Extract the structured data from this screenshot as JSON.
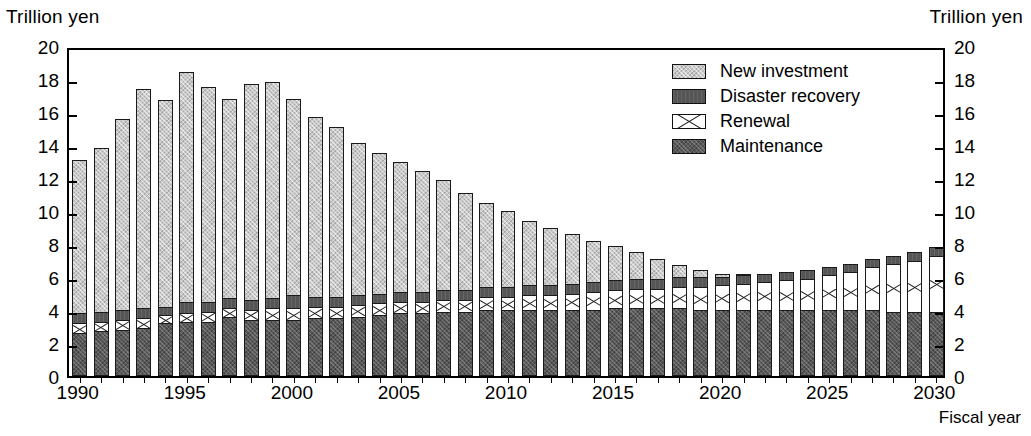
{
  "axis": {
    "unit_left": "Trillion yen",
    "unit_right": "Trillion yen",
    "xlabel": "Fiscal year"
  },
  "legend": {
    "items": [
      {
        "label": "New investment",
        "key": "new_investment",
        "swatch": "light-gray-hatch"
      },
      {
        "label": "Disaster recovery",
        "key": "disaster_recovery",
        "swatch": "dark-gray-solid"
      },
      {
        "label": "Renewal",
        "key": "renewal",
        "swatch": "white-cross-hatch"
      },
      {
        "label": "Maintenance",
        "key": "maintenance",
        "swatch": "dark-gray-hatch"
      }
    ]
  },
  "chart_data": {
    "type": "bar",
    "stacked": true,
    "title": "",
    "xlabel": "Fiscal year",
    "ylabel": "Trillion yen",
    "ylim": [
      0,
      20
    ],
    "ytick_step": 2,
    "yticks": [
      0,
      2,
      4,
      6,
      8,
      10,
      12,
      14,
      16,
      18,
      20
    ],
    "xtick_labels": [
      "1990",
      "1995",
      "2000",
      "2005",
      "2010",
      "2015",
      "2020",
      "2025",
      "2030"
    ],
    "xtick_years": [
      1990,
      1995,
      2000,
      2005,
      2010,
      2015,
      2020,
      2025,
      2030
    ],
    "grid": false,
    "legend_position": "top-right",
    "categories": [
      1990,
      1991,
      1992,
      1993,
      1994,
      1995,
      1996,
      1997,
      1998,
      1999,
      2000,
      2001,
      2002,
      2003,
      2004,
      2005,
      2006,
      2007,
      2008,
      2009,
      2010,
      2011,
      2012,
      2013,
      2014,
      2015,
      2016,
      2017,
      2018,
      2019,
      2020,
      2021,
      2022,
      2023,
      2024,
      2025,
      2026,
      2027,
      2028,
      2029,
      2030
    ],
    "stack_order_bottom_to_top": [
      "maintenance",
      "renewal",
      "disaster_recovery",
      "new_investment"
    ],
    "series": [
      {
        "name": "Maintenance",
        "values": [
          2.6,
          2.7,
          2.8,
          2.9,
          3.2,
          3.3,
          3.3,
          3.6,
          3.4,
          3.4,
          3.4,
          3.5,
          3.5,
          3.6,
          3.7,
          3.8,
          3.8,
          3.9,
          3.9,
          4.0,
          4.0,
          4.0,
          4.0,
          4.0,
          4.0,
          4.1,
          4.1,
          4.1,
          4.1,
          4.0,
          4.0,
          4.0,
          4.0,
          4.0,
          4.0,
          4.0,
          4.0,
          4.0,
          3.9,
          3.9,
          3.9
        ]
      },
      {
        "name": "Renewal",
        "values": [
          0.6,
          0.6,
          0.6,
          0.6,
          0.5,
          0.5,
          0.6,
          0.5,
          0.6,
          0.7,
          0.7,
          0.7,
          0.7,
          0.7,
          0.7,
          0.7,
          0.7,
          0.7,
          0.7,
          0.8,
          0.8,
          0.9,
          0.9,
          1.0,
          1.1,
          1.1,
          1.2,
          1.2,
          1.3,
          1.4,
          1.5,
          1.6,
          1.7,
          1.8,
          1.9,
          2.1,
          2.3,
          2.6,
          2.9,
          3.1,
          3.4
        ]
      },
      {
        "name": "Disaster recovery",
        "values": [
          0.6,
          0.6,
          0.6,
          0.6,
          0.5,
          0.7,
          0.6,
          0.6,
          0.6,
          0.6,
          0.8,
          0.6,
          0.6,
          0.6,
          0.6,
          0.6,
          0.6,
          0.6,
          0.6,
          0.6,
          0.6,
          0.6,
          0.6,
          0.6,
          0.6,
          0.6,
          0.6,
          0.6,
          0.6,
          0.6,
          0.5,
          0.5,
          0.5,
          0.5,
          0.5,
          0.5,
          0.5,
          0.5,
          0.5,
          0.5,
          0.5
        ]
      },
      {
        "name": "New investment",
        "values": [
          9.3,
          9.9,
          11.6,
          13.3,
          12.5,
          13.9,
          13.0,
          12.1,
          13.1,
          13.1,
          11.9,
          10.9,
          10.3,
          9.2,
          8.5,
          7.9,
          7.3,
          6.7,
          5.9,
          5.1,
          4.6,
          3.9,
          3.5,
          3.0,
          2.5,
          2.1,
          1.6,
          1.2,
          0.7,
          0.4,
          0.2,
          0.1,
          0.0,
          0.0,
          0.0,
          0.0,
          0.0,
          0.0,
          0.0,
          0.0,
          0.0
        ]
      }
    ],
    "totals": [
      13.1,
      13.8,
      15.6,
      17.4,
      16.7,
      18.4,
      17.5,
      16.8,
      17.7,
      17.8,
      16.8,
      15.7,
      15.1,
      14.1,
      13.8,
      13.0,
      12.4,
      11.9,
      11.2,
      10.8,
      10.4,
      9.9,
      9.5,
      9.1,
      8.7,
      8.3,
      7.9,
      7.6,
      7.2,
      6.9,
      6.6,
      6.4,
      6.5,
      6.6,
      6.8,
      6.9,
      7.1,
      7.3,
      7.5,
      7.6,
      7.8
    ]
  }
}
